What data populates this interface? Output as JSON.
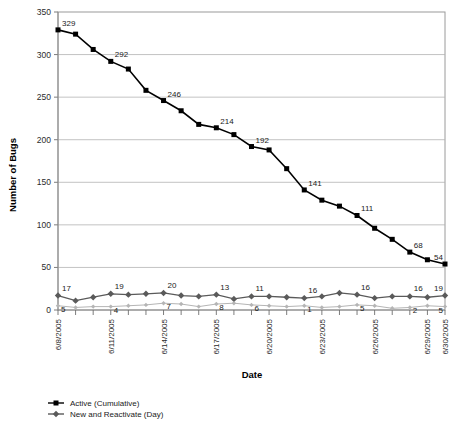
{
  "chart_data": {
    "type": "line",
    "title": "",
    "xlabel": "Date",
    "ylabel": "Number of Bugs",
    "ylim": [
      0,
      350
    ],
    "ytick_step": 50,
    "yticks": [
      "0",
      "50",
      "100",
      "150",
      "200",
      "250",
      "300",
      "350"
    ],
    "grid": true,
    "legend_position": "bottom-left",
    "x": [
      "6/8/2005",
      "6/9/2005",
      "6/10/2005",
      "6/11/2005",
      "6/12/2005",
      "6/13/2005",
      "6/14/2005",
      "6/15/2005",
      "6/16/2005",
      "6/17/2005",
      "6/18/2005",
      "6/19/2005",
      "6/20/2005",
      "6/21/2005",
      "6/22/2005",
      "6/23/2005",
      "6/24/2005",
      "6/25/2005",
      "6/26/2005",
      "6/27/2005",
      "6/28/2005",
      "6/29/2005",
      "6/30/2005"
    ],
    "xtick_labels": [
      "6/8/2005",
      "",
      "",
      "6/11/2005",
      "",
      "",
      "6/14/2005",
      "",
      "",
      "6/17/2005",
      "",
      "",
      "6/20/2005",
      "",
      "",
      "6/23/2005",
      "",
      "",
      "6/26/2005",
      "",
      "",
      "6/29/2005",
      "6/30/2005"
    ],
    "series": [
      {
        "name": "Active (Cumulative)",
        "marker": "square",
        "color": "#000000",
        "values": [
          329,
          324,
          306,
          292,
          283,
          258,
          246,
          234,
          218,
          214,
          206,
          192,
          188,
          166,
          141,
          129,
          122,
          111,
          96,
          83,
          68,
          59,
          54
        ],
        "labels": [
          "329",
          "",
          "",
          "292",
          "",
          "",
          "246",
          "",
          "",
          "214",
          "",
          "192",
          "",
          "",
          "141",
          "",
          "",
          "111",
          "",
          "",
          "68",
          "",
          "54"
        ]
      },
      {
        "name": "New and Reactivate (Day)",
        "marker": "diamond",
        "color": "#5a5a5a",
        "values": [
          17,
          11,
          15,
          19,
          18,
          19,
          20,
          17,
          16,
          18,
          13,
          16,
          16,
          15,
          14,
          16,
          20,
          18,
          14,
          16,
          16,
          15,
          17
        ],
        "labels": [
          "17",
          "",
          "",
          "19",
          "",
          "",
          "20",
          "",
          "",
          "13",
          "",
          "11",
          "",
          "",
          "16",
          "",
          "",
          "16",
          "",
          "",
          "16",
          "",
          "19"
        ]
      },
      {
        "name": "",
        "marker": "diamond-small",
        "color": "#b5b5b5",
        "values": [
          5,
          3,
          4,
          4,
          5,
          6,
          8,
          7,
          4,
          7,
          8,
          6,
          5,
          4,
          5,
          3,
          4,
          6,
          5,
          2,
          3,
          5,
          4
        ],
        "labels": [
          "5",
          "",
          "",
          "4",
          "",
          "",
          "7",
          "",
          "",
          "8",
          "",
          "6",
          "",
          "",
          "1",
          "",
          "",
          "5",
          "",
          "",
          "2",
          "",
          "5"
        ]
      }
    ],
    "legend": [
      {
        "label": "Active (Cumulative)",
        "marker": "square",
        "color": "#000000"
      },
      {
        "label": "New and Reactivate (Day)",
        "marker": "diamond",
        "color": "#5a5a5a"
      }
    ]
  }
}
